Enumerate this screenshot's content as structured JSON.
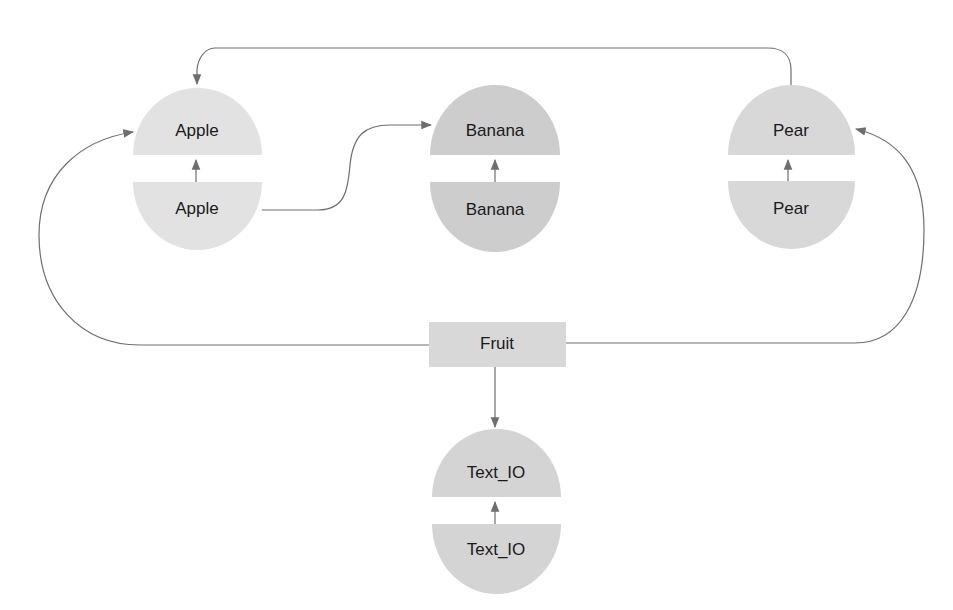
{
  "diagram": {
    "type": "package dependency diagram",
    "nodes": {
      "apple_spec": {
        "label": "Apple",
        "shape": "half-circle-top",
        "fill": "#e2e2e2"
      },
      "apple_body": {
        "label": "Apple",
        "shape": "half-circle-bottom",
        "fill": "#e2e2e2"
      },
      "banana_spec": {
        "label": "Banana",
        "shape": "half-circle-top",
        "fill": "#cdcdcd"
      },
      "banana_body": {
        "label": "Banana",
        "shape": "half-circle-bottom",
        "fill": "#cdcdcd"
      },
      "pear_spec": {
        "label": "Pear",
        "shape": "half-circle-top",
        "fill": "#d8d8d8"
      },
      "pear_body": {
        "label": "Pear",
        "shape": "half-circle-bottom",
        "fill": "#d8d8d8"
      },
      "fruit": {
        "label": "Fruit",
        "shape": "rectangle",
        "fill": "#d8d8d8"
      },
      "textio_spec": {
        "label": "Text_IO",
        "shape": "half-circle-top",
        "fill": "#d4d4d4"
      },
      "textio_body": {
        "label": "Text_IO",
        "shape": "half-circle-bottom",
        "fill": "#d4d4d4"
      }
    },
    "edges": [
      {
        "from": "apple_body",
        "to": "apple_spec"
      },
      {
        "from": "banana_body",
        "to": "banana_spec"
      },
      {
        "from": "pear_body",
        "to": "pear_spec"
      },
      {
        "from": "textio_body",
        "to": "textio_spec"
      },
      {
        "from": "apple_body",
        "to": "banana_spec"
      },
      {
        "from": "pear_spec",
        "to": "apple_spec"
      },
      {
        "from": "fruit",
        "to": "apple_spec"
      },
      {
        "from": "fruit",
        "to": "pear_spec"
      },
      {
        "from": "fruit",
        "to": "textio_spec"
      }
    ],
    "colors": {
      "edge": "#6e6e6e",
      "text": "#1a1a1a"
    }
  }
}
